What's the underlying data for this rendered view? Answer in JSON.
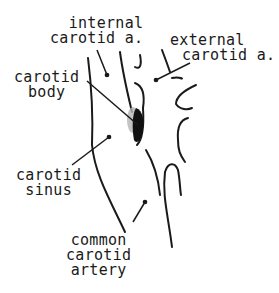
{
  "diagram": {
    "style": "black ink line drawing on white",
    "colors": {
      "ink": "#1a1a1a",
      "background": "#ffffff",
      "stipple": "#9a9a9a"
    },
    "labels": {
      "internal_carotid": {
        "line1": "internal",
        "line2": "carotid a."
      },
      "external_carotid": {
        "line1": "external",
        "line2": "carotid a."
      },
      "carotid_body": {
        "line1": "carotid",
        "line2": "body"
      },
      "carotid_sinus": {
        "line1": "carotid",
        "line2": "sinus"
      },
      "common_carotid": {
        "line1": "common",
        "line2": "carotid",
        "line3": "artery"
      }
    }
  }
}
